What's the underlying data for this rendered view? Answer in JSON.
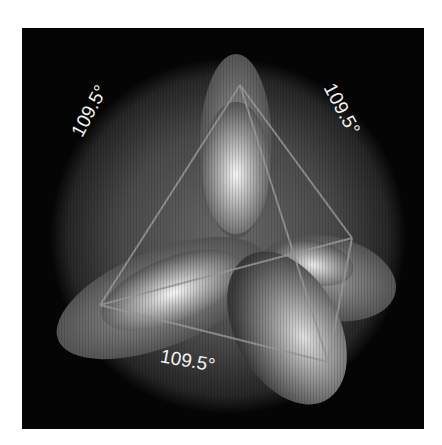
{
  "figure": {
    "background_color": "#050505",
    "labels": [
      {
        "id": "left",
        "text": "109.5°",
        "x": 48,
        "y": 58,
        "rotate": -62
      },
      {
        "id": "right",
        "text": "109.5°",
        "x": 298,
        "y": 58,
        "rotate": 62
      },
      {
        "id": "bottom",
        "text": "109.5°",
        "x": 135,
        "y": 325,
        "rotate": 10
      }
    ],
    "tetrahedron_vertices": {
      "top": [
        218,
        57
      ],
      "right": [
        330,
        210
      ],
      "left": [
        78,
        277
      ],
      "bottom_right": [
        306,
        334
      ]
    },
    "orbitals": [
      "top-lobe",
      "left-lobe",
      "right-back-lobe",
      "bottom-right-lobe"
    ]
  }
}
